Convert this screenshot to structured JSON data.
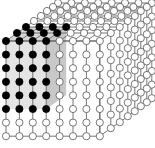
{
  "diagram": {
    "type": "3d-lattice-cube",
    "grid": {
      "columns": 8,
      "rows": 8,
      "depth": 8
    },
    "front_origin": [
      6,
      41
    ],
    "spacing_x": 13.4,
    "spacing_y": 13.6,
    "depth_offsets_x": [
      0,
      11,
      20,
      28,
      35,
      41,
      47,
      52
    ],
    "depth_offsets_y": [
      0,
      -8,
      -14,
      -20,
      -25,
      -30,
      -34,
      -38
    ],
    "node_radius": 3.6,
    "highlight": {
      "columns": 4,
      "rows": 6,
      "depth": 3,
      "node_color": "#000000",
      "slab_front_color": "#e4e4e4",
      "slab_side_color": "#c8c8c8",
      "slab_top_color": "#d6d6d6"
    },
    "colors": {
      "edge": "#555555",
      "node_fill": "#ffffff",
      "node_stroke": "#555555",
      "background": "#ffffff"
    }
  }
}
